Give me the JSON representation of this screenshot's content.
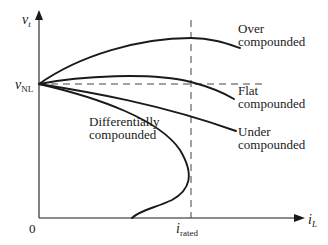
{
  "diagram": {
    "type": "terminal-characteristics",
    "axes": {
      "y_label_main": "v",
      "y_label_sub": "t",
      "x_label_main": "i",
      "x_label_sub": "L",
      "origin_label": "0",
      "y_marker_main": "v",
      "y_marker_sub": "NL",
      "x_marker_main": "i",
      "x_marker_sub": "rated"
    },
    "curves": [
      {
        "id": "over",
        "line1": "Over",
        "line2": "compounded"
      },
      {
        "id": "flat",
        "line1": "Flat",
        "line2": "compounded"
      },
      {
        "id": "under",
        "line1": "Under",
        "line2": "compounded"
      },
      {
        "id": "differential",
        "line1": "Differentially",
        "line2": "compounded"
      }
    ],
    "colors": {
      "ink": "#1a1a1a",
      "background": "#ffffff"
    }
  }
}
